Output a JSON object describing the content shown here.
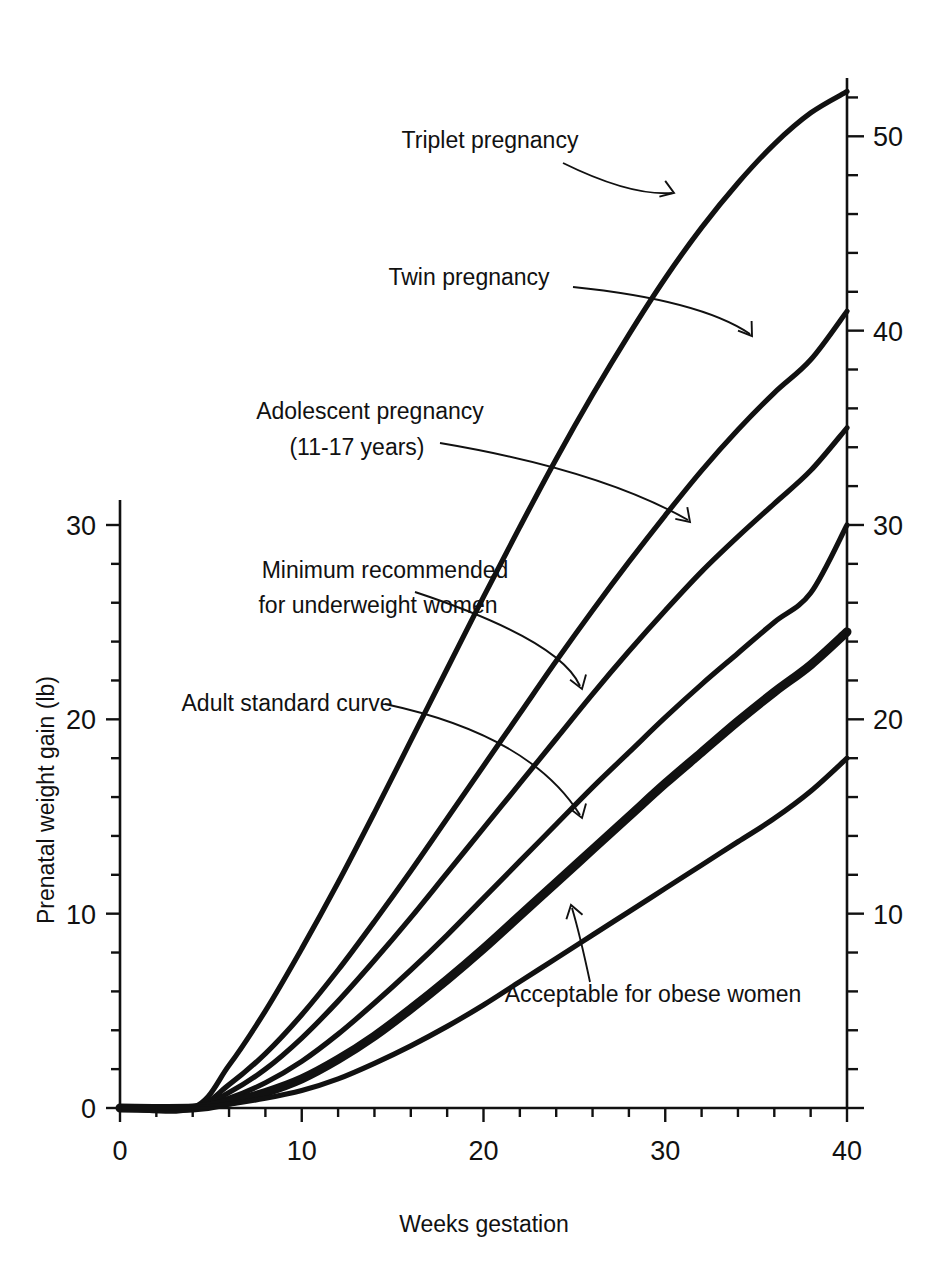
{
  "chart_data": {
    "type": "line",
    "title": "",
    "xlabel": "Weeks gestation",
    "ylabel": "Prenatal weight gain (lb)",
    "xlim": [
      0,
      40
    ],
    "ylim_left": [
      0,
      31
    ],
    "ylim_right": [
      0,
      53
    ],
    "grid": false,
    "legend_position": "inline-annotations",
    "x_ticks_major": [
      "0",
      "10",
      "20",
      "30",
      "40"
    ],
    "x_tick_interval": 2,
    "y_ticks_left_major": [
      "0",
      "10",
      "20",
      "30"
    ],
    "y_ticks_right_major": [
      "10",
      "20",
      "30",
      "40",
      "50"
    ],
    "y_tick_interval": 2,
    "x": [
      0,
      4,
      6,
      8,
      10,
      12,
      14,
      16,
      18,
      20,
      22,
      24,
      26,
      28,
      30,
      32,
      34,
      36,
      38,
      40
    ],
    "series": [
      {
        "name": "Triplet pregnancy",
        "values": [
          0,
          0,
          2.2,
          5.0,
          8.2,
          11.6,
          15.2,
          18.9,
          22.6,
          26.3,
          29.9,
          33.4,
          36.7,
          39.8,
          42.7,
          45.3,
          47.6,
          49.6,
          51.2,
          52.3
        ],
        "width": "bold"
      },
      {
        "name": "Twin pregnancy",
        "values": [
          0,
          0,
          1.2,
          2.8,
          4.8,
          7.1,
          9.6,
          12.2,
          14.9,
          17.6,
          20.3,
          23.0,
          25.6,
          28.1,
          30.5,
          32.8,
          34.9,
          36.8,
          38.5,
          41.0
        ],
        "width": "bold"
      },
      {
        "name": "Adolescent pregnancy (11-17 years)",
        "values": [
          0,
          0,
          0.8,
          2.0,
          3.6,
          5.5,
          7.6,
          9.8,
          12.1,
          14.4,
          16.7,
          19.0,
          21.3,
          23.5,
          25.6,
          27.6,
          29.4,
          31.1,
          32.8,
          35.0
        ],
        "width": "bold"
      },
      {
        "name": "Minimum recommended for underweight women",
        "values": [
          0,
          0,
          0.5,
          1.3,
          2.4,
          3.8,
          5.4,
          7.1,
          8.9,
          10.8,
          12.7,
          14.6,
          16.5,
          18.3,
          20.1,
          21.8,
          23.4,
          25.0,
          26.5,
          30.0
        ],
        "width": "bold"
      },
      {
        "name": "Adult standard curve",
        "values": [
          0,
          0,
          0.3,
          0.8,
          1.5,
          2.5,
          3.7,
          5.1,
          6.6,
          8.2,
          9.9,
          11.6,
          13.3,
          15.0,
          16.7,
          18.3,
          19.9,
          21.4,
          22.8,
          24.5
        ],
        "width": "extra-bold"
      },
      {
        "name": "Acceptable for obese women",
        "values": [
          0,
          0,
          0.2,
          0.5,
          0.9,
          1.5,
          2.3,
          3.2,
          4.2,
          5.3,
          6.5,
          7.7,
          8.9,
          10.1,
          11.3,
          12.5,
          13.7,
          14.9,
          16.3,
          18.0
        ],
        "width": "bold"
      }
    ],
    "annotations": [
      {
        "text": "Triplet pregnancy",
        "points_to_series": "Triplet pregnancy"
      },
      {
        "text": "Twin pregnancy",
        "points_to_series": "Twin pregnancy"
      },
      {
        "text": "Adolescent pregnancy",
        "text2": "(11-17 years)",
        "points_to_series": "Adolescent pregnancy (11-17 years)"
      },
      {
        "text": "Minimum recommended",
        "text2": "for underweight women",
        "points_to_series": "Minimum recommended for underweight women"
      },
      {
        "text": "Adult standard curve",
        "points_to_series": "Adult standard curve"
      },
      {
        "text": "Acceptable for obese women",
        "points_to_series": "Acceptable for obese women"
      }
    ],
    "colors": {
      "line": "#111111",
      "background": "#ffffff",
      "text": "#111111"
    }
  },
  "axes": {
    "x_title": "Weeks gestation",
    "y_title": "Prenatal weight gain (lb)",
    "x_labels": [
      "0",
      "10",
      "20",
      "30",
      "40"
    ],
    "y_left_labels": [
      "0",
      "10",
      "20",
      "30"
    ],
    "y_right_labels": [
      "10",
      "20",
      "30",
      "40",
      "50"
    ]
  },
  "labels": {
    "triplet": "Triplet pregnancy",
    "twin": "Twin pregnancy",
    "adolescent_line1": "Adolescent pregnancy",
    "adolescent_line2": "(11-17 years)",
    "minimum_line1": "Minimum recommended",
    "minimum_line2": "for underweight women",
    "adult": "Adult standard curve",
    "obese": "Acceptable for obese women"
  }
}
